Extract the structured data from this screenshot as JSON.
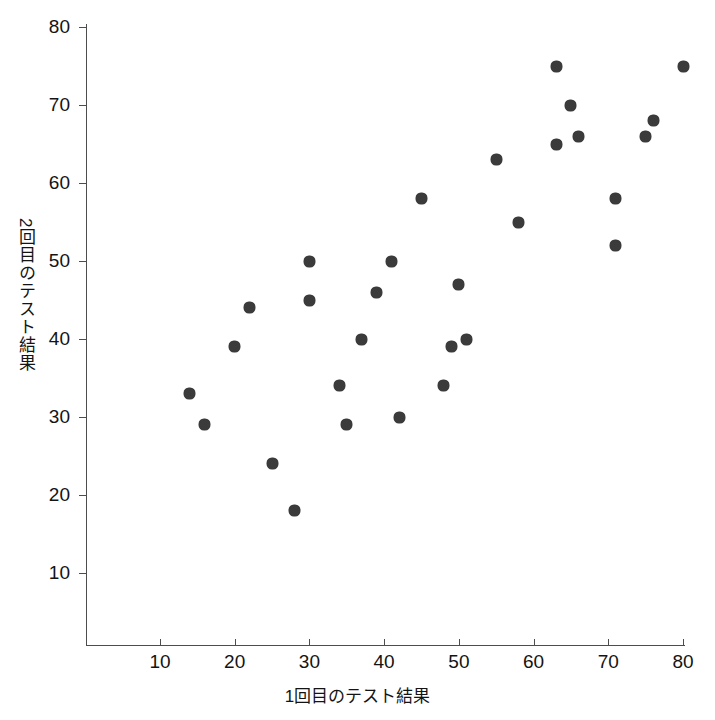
{
  "chart_data": {
    "type": "scatter",
    "title": "",
    "xlabel": "1回目のテスト結果",
    "ylabel": "2回目のテスト結果",
    "xlim": [
      0,
      84
    ],
    "ylim": [
      4,
      82
    ],
    "xticks": [
      10,
      20,
      30,
      40,
      50,
      60,
      70,
      80
    ],
    "yticks": [
      10,
      20,
      30,
      40,
      50,
      60,
      70,
      80
    ],
    "grid": false,
    "legend": null,
    "marker": {
      "shape": "filled-circle",
      "color": "#3b3b3b",
      "size": 11
    },
    "points": [
      {
        "x": 14,
        "y": 33
      },
      {
        "x": 16,
        "y": 29
      },
      {
        "x": 20,
        "y": 39
      },
      {
        "x": 22,
        "y": 44
      },
      {
        "x": 25,
        "y": 24
      },
      {
        "x": 28,
        "y": 18
      },
      {
        "x": 30,
        "y": 50
      },
      {
        "x": 30,
        "y": 45
      },
      {
        "x": 34,
        "y": 34
      },
      {
        "x": 35,
        "y": 29
      },
      {
        "x": 37,
        "y": 40
      },
      {
        "x": 39,
        "y": 46
      },
      {
        "x": 41,
        "y": 50
      },
      {
        "x": 42,
        "y": 30
      },
      {
        "x": 45,
        "y": 58
      },
      {
        "x": 48,
        "y": 34
      },
      {
        "x": 49,
        "y": 39
      },
      {
        "x": 50,
        "y": 47
      },
      {
        "x": 51,
        "y": 40
      },
      {
        "x": 55,
        "y": 63
      },
      {
        "x": 58,
        "y": 55
      },
      {
        "x": 63,
        "y": 75
      },
      {
        "x": 63,
        "y": 65
      },
      {
        "x": 65,
        "y": 70
      },
      {
        "x": 66,
        "y": 66
      },
      {
        "x": 71,
        "y": 58
      },
      {
        "x": 71,
        "y": 52
      },
      {
        "x": 75,
        "y": 66
      },
      {
        "x": 76,
        "y": 68
      },
      {
        "x": 80,
        "y": 75
      }
    ]
  }
}
